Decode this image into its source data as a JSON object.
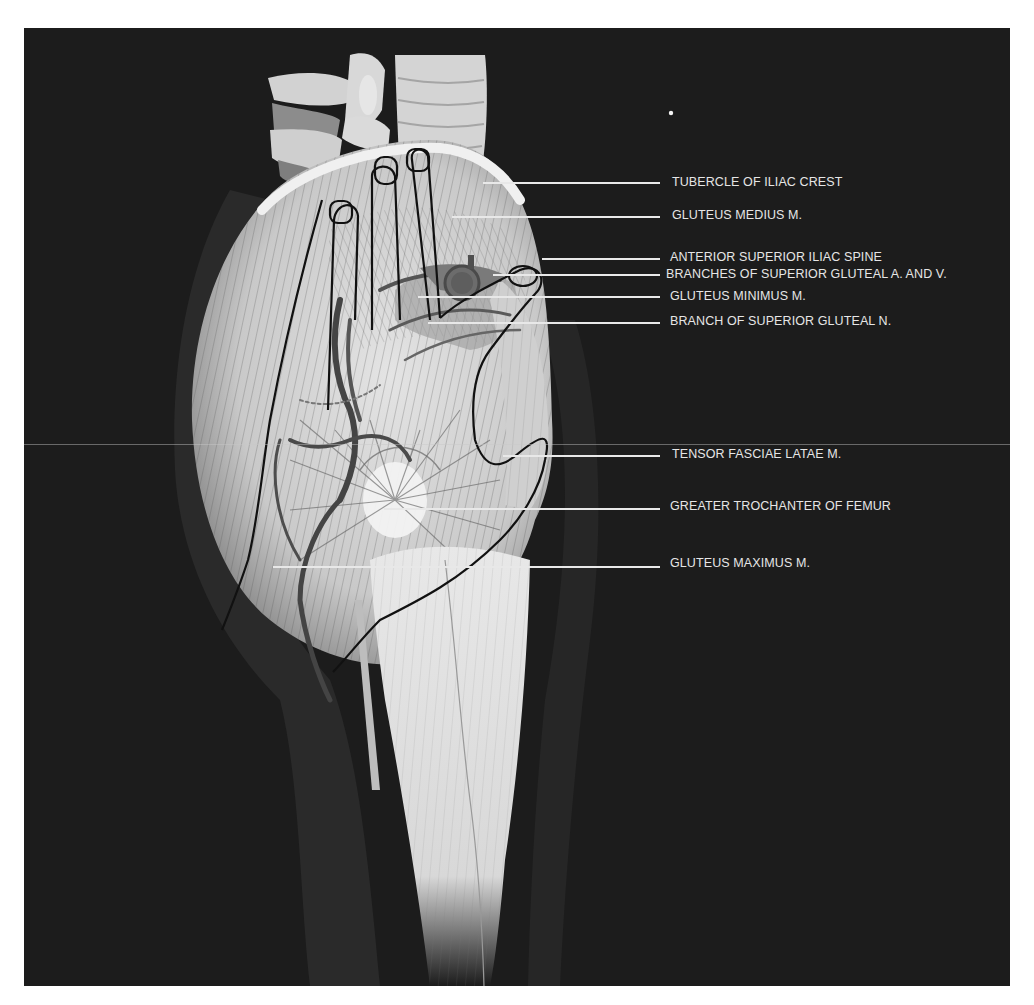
{
  "figure": {
    "background": "#1c1c1c",
    "page_background": "#ffffff",
    "label_color": "#e6e6e6",
    "leader_color": "#e8e8e8"
  },
  "labels": [
    {
      "id": "tubercle-of-iliac-crest",
      "text": "TUBERCLE OF ILIAC CREST",
      "x": 672,
      "y": 175,
      "line_from": 483,
      "line_y": 183
    },
    {
      "id": "gluteus-medius",
      "text": "GLUTEUS MEDIUS M.",
      "x": 672,
      "y": 208,
      "line_from": 452,
      "line_y": 217
    },
    {
      "id": "anterior-superior-iliac-spine",
      "text": "ANTERIOR SUPERIOR ILIAC SPINE",
      "x": 670,
      "y": 250,
      "line_from": 542,
      "line_y": 259
    },
    {
      "id": "branches-superior-gluteal-av",
      "text": "BRANCHES OF SUPERIOR GLUTEAL A. AND V.",
      "x": 666,
      "y": 267,
      "line_from": 493,
      "line_y": 275
    },
    {
      "id": "gluteus-minimus",
      "text": "GLUTEUS MINIMUS M.",
      "x": 670,
      "y": 289,
      "line_from": 418,
      "line_y": 297
    },
    {
      "id": "branch-superior-gluteal-n",
      "text": "BRANCH OF SUPERIOR GLUTEAL N.",
      "x": 670,
      "y": 314,
      "line_from": 428,
      "line_y": 323
    },
    {
      "id": "tensor-fasciae-latae",
      "text": "TENSOR FASCIAE LATAE M.",
      "x": 672,
      "y": 447,
      "line_from": 503,
      "line_y": 456
    },
    {
      "id": "greater-trochanter",
      "text": "GREATER TROCHANTER OF FEMUR",
      "x": 670,
      "y": 499,
      "line_from": 384,
      "line_y": 509
    },
    {
      "id": "gluteus-maximus",
      "text": "GLUTEUS MAXIMUS M.",
      "x": 670,
      "y": 556,
      "line_from": 273,
      "line_y": 567
    }
  ]
}
